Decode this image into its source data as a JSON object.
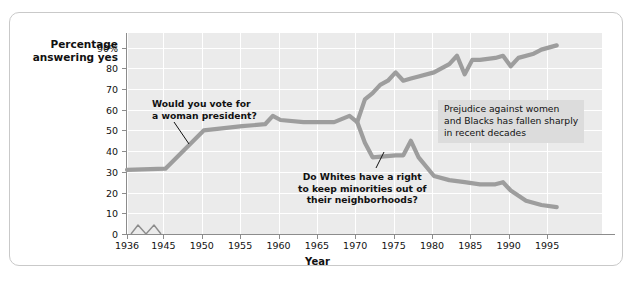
{
  "chart_data": {
    "type": "line",
    "title": "",
    "xlabel": "Year",
    "ylabel": "Percentage answering yes",
    "xlim": [
      1936,
      1998
    ],
    "ylim": [
      0,
      95
    ],
    "grid": true,
    "legend": "none",
    "x_ticks": [
      "1936",
      "1945",
      "1950",
      "1955",
      "1960",
      "1965",
      "1970",
      "1975",
      "1980",
      "1985",
      "1990",
      "1995"
    ],
    "y_ticks": [
      "0",
      "10",
      "20",
      "30",
      "40",
      "50",
      "60",
      "70",
      "80",
      "90%"
    ],
    "axis_break": "x-axis break between 1936 and 1945",
    "series": [
      {
        "name": "Would you vote for a woman president?",
        "color": "#9d9d9d",
        "points": [
          [
            1936,
            31
          ],
          [
            1945,
            31.5
          ],
          [
            1950,
            50
          ],
          [
            1955,
            52
          ],
          [
            1958,
            53
          ],
          [
            1959,
            57
          ],
          [
            1960,
            55
          ],
          [
            1963,
            54
          ],
          [
            1965,
            54
          ],
          [
            1967,
            54
          ],
          [
            1969,
            57
          ],
          [
            1970,
            54
          ],
          [
            1971,
            65
          ],
          [
            1972,
            68
          ],
          [
            1973,
            72
          ],
          [
            1974,
            74
          ],
          [
            1975,
            78
          ],
          [
            1976,
            74
          ],
          [
            1977,
            75
          ],
          [
            1978,
            76
          ],
          [
            1980,
            78
          ],
          [
            1982,
            82
          ],
          [
            1983,
            86
          ],
          [
            1984,
            77
          ],
          [
            1985,
            84
          ],
          [
            1986,
            84
          ],
          [
            1988,
            85
          ],
          [
            1989,
            86
          ],
          [
            1990,
            81
          ],
          [
            1991,
            85
          ],
          [
            1993,
            87
          ],
          [
            1994,
            89
          ],
          [
            1996,
            91
          ]
        ]
      },
      {
        "name": "Do Whites have a right to keep minorities out of their neighborhoods?",
        "color": "#9d9d9d",
        "points": [
          [
            1970,
            54
          ],
          [
            1971,
            44
          ],
          [
            1972,
            37
          ],
          [
            1975,
            38
          ],
          [
            1976,
            38
          ],
          [
            1977,
            45
          ],
          [
            1978,
            37
          ],
          [
            1980,
            28
          ],
          [
            1982,
            26
          ],
          [
            1984,
            25
          ],
          [
            1986,
            24
          ],
          [
            1988,
            24
          ],
          [
            1989,
            25
          ],
          [
            1990,
            21
          ],
          [
            1992,
            16
          ],
          [
            1994,
            14
          ],
          [
            1996,
            13
          ]
        ]
      }
    ],
    "annotations": [
      {
        "id": "anno1",
        "text_lines": [
          "Would you vote for",
          "a woman president?"
        ],
        "style": "bold",
        "has_leader_line": true,
        "boxed": false
      },
      {
        "id": "anno2",
        "text_lines": [
          "Do Whites have a right",
          "to keep minorities out of",
          "their neighborhoods?"
        ],
        "style": "bold",
        "has_leader_line": true,
        "boxed": false
      },
      {
        "id": "anno3",
        "text_lines": [
          "Prejudice against women",
          "and Blacks has fallen sharply",
          "in recent decades"
        ],
        "style": "normal",
        "has_leader_line": false,
        "boxed": true,
        "box_color": "#dcdcdc"
      }
    ]
  },
  "colors": {
    "line": "#9d9d9d",
    "plot_background": "#ebebeb",
    "gridline": "#ffffff",
    "axis": "#8c8c8c",
    "frame": "#c9c9c9",
    "text": "#111111",
    "annotation_box": "#dcdcdc"
  }
}
